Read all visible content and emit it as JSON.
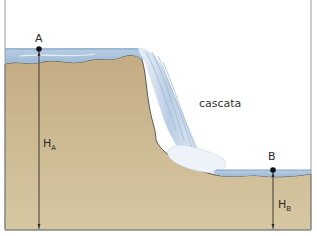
{
  "diagram": {
    "title": "",
    "labels": {
      "waterfall": "cascata",
      "point_a": "A",
      "point_b": "B",
      "height_a_main": "H",
      "height_a_sub": "A",
      "height_b_main": "H",
      "height_b_sub": "B"
    },
    "colors": {
      "sky": "#ffffff",
      "ground": "#cbb894",
      "ground_dark": "#b59f78",
      "ground_outline": "#4a4a44",
      "water": "#a9c3dc",
      "water_light": "#d9e6f2",
      "foam": "#eef3f9",
      "frame": "#9a9a9a",
      "marker": "#111111"
    },
    "elements": [
      {
        "id": "upper-river",
        "description": "water surface at higher level, point A"
      },
      {
        "id": "waterfall",
        "description": "water falling over cliff edge"
      },
      {
        "id": "lower-pool",
        "description": "water surface at lower level, point B"
      },
      {
        "id": "height-a-arrow",
        "description": "vertical line from A down to base"
      },
      {
        "id": "height-b-arrow",
        "description": "vertical line from B down to base"
      }
    ]
  }
}
